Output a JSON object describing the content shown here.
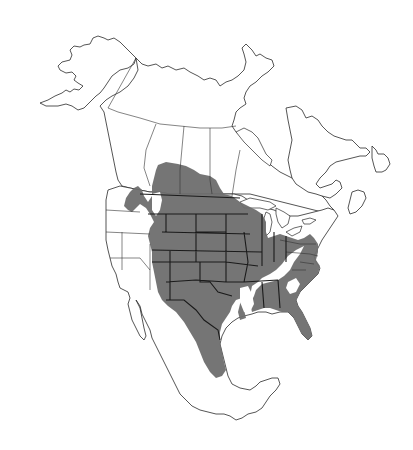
{
  "map": {
    "kind": "species range map",
    "region": "North America",
    "style": "grayscale outline map with shaded range",
    "colors": {
      "background": "#ffffff",
      "land": "#ffffff",
      "outline": "#2a2a2a",
      "range_fill": "#6e6e6e",
      "range_border": "#1a1a1a"
    },
    "countries_shown": [
      "Canada",
      "United States",
      "Mexico"
    ],
    "range": {
      "description": "Shaded range covering the Great Plains, Midwest, southern Canadian prairies, southeastern US and eastern Mexico",
      "includes": [
        "Southern Alberta",
        "Southern Saskatchewan",
        "Southern Manitoba",
        "Eastern Washington",
        "Idaho",
        "Montana",
        "Wyoming",
        "Colorado",
        "North Dakota",
        "South Dakota",
        "Nebraska",
        "Kansas",
        "Oklahoma",
        "Texas",
        "New Mexico",
        "Arizona",
        "Minnesota",
        "Iowa",
        "Missouri",
        "Wisconsin",
        "Illinois",
        "Indiana",
        "Ohio",
        "Kentucky",
        "Tennessee",
        "Arkansas",
        "Mississippi",
        "Alabama",
        "Georgia",
        "Florida",
        "South Carolina",
        "North Carolina",
        "Virginia",
        "Maryland",
        "Delaware",
        "New Jersey",
        "Eastern Mexico"
      ]
    },
    "labels": []
  }
}
